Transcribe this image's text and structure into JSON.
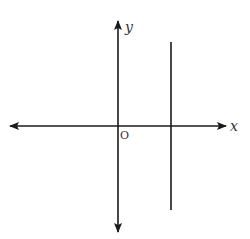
{
  "diagram": {
    "type": "coordinate-plane",
    "axes": {
      "x_label": "x",
      "y_label": "y",
      "origin_label": "O"
    },
    "line": {
      "kind": "vertical",
      "description": "vertical line x = a, a > 0",
      "position": "right of y-axis"
    },
    "colors": {
      "stroke": "#1a1a1a",
      "label": "#333333",
      "background": "#ffffff"
    }
  }
}
